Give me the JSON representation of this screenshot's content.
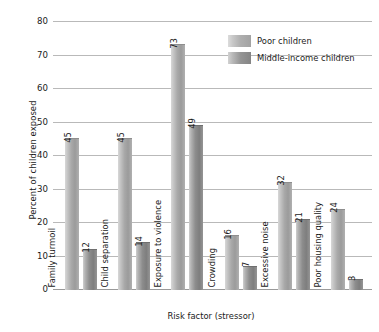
{
  "chart_data": {
    "type": "bar",
    "title": "",
    "xlabel": "Risk factor (stressor)",
    "ylabel": "Percent of children exposed",
    "categories": [
      "Family turmoil",
      "Child separation",
      "Exposure to violence",
      "Crowding",
      "Excessive noise",
      "Poor housing quality"
    ],
    "series": [
      {
        "name": "Poor children",
        "values": [
          45,
          45,
          73,
          16,
          32,
          24
        ]
      },
      {
        "name": "Middle-income children",
        "values": [
          12,
          14,
          49,
          7,
          21,
          3
        ]
      }
    ],
    "ylim": [
      0,
      80
    ],
    "ytick_labels": [
      "0",
      "10",
      "20",
      "30",
      "40",
      "50",
      "60",
      "70",
      "80"
    ],
    "ytick_values": [
      0,
      10,
      20,
      30,
      40,
      50,
      60,
      70,
      80
    ],
    "grid": "horizontal",
    "legend_position": "top-right-inside",
    "colors": {
      "poor_children": "#a9a9a9",
      "middle_income_children": "#8d8d8d",
      "gridline": "#b9b9b9",
      "text": "#1a1a1a",
      "background": "#ffffff"
    }
  },
  "legend": {
    "items": [
      {
        "label": "Poor children",
        "swatch": "poor"
      },
      {
        "label": "Middle-income children",
        "swatch": "middle"
      }
    ]
  }
}
